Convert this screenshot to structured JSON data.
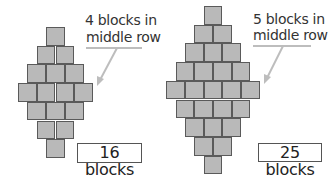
{
  "figures": [
    {
      "id": "left",
      "caption_line1": "4 blocks in",
      "caption_line2": "middle row",
      "total_label": "16 blocks",
      "middle_row_count": 4,
      "total": 16,
      "rows": [
        1,
        2,
        3,
        4,
        3,
        2,
        1
      ]
    },
    {
      "id": "right",
      "caption_line1": "5 blocks in",
      "caption_line2": "middle row",
      "total_label": "25 blocks",
      "middle_row_count": 5,
      "total": 25,
      "rows": [
        1,
        2,
        3,
        4,
        5,
        4,
        3,
        2,
        1
      ]
    }
  ],
  "colors": {
    "block_fill": "#b9b9b9",
    "block_border": "#5a5a5a",
    "arrow": "#bdbdbd"
  }
}
